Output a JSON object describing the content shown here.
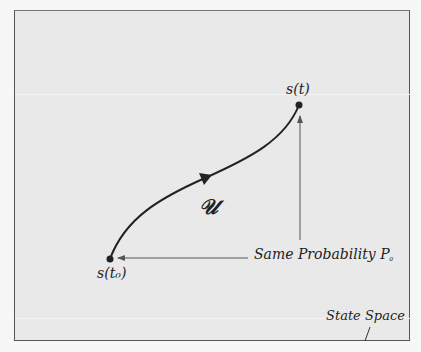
{
  "diagram": {
    "title_label": "State Space",
    "nodes": [
      {
        "id": "start",
        "label": "s(t₀)",
        "x": 110,
        "y": 259
      },
      {
        "id": "end",
        "label": "s(t)",
        "x": 299,
        "y": 105
      }
    ],
    "trajectory": {
      "label": "𝒰",
      "from": "start",
      "to": "end",
      "direction_arrow": "forward"
    },
    "annotation": {
      "text": "Same Probability P",
      "subscript": "₀",
      "arrows_to": [
        "start",
        "end"
      ]
    },
    "colors": {
      "background": "#e9e9e9",
      "ink": "#222222",
      "thin_arrow": "#555555",
      "border": "#555555"
    }
  }
}
